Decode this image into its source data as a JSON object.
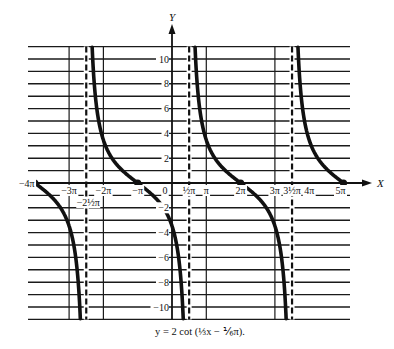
{
  "chart_data": {
    "type": "line",
    "title": "",
    "caption": "y = 2 cot (⅓x − ⅙π).",
    "function": "y = 2*cot(x/3 - pi/6)",
    "xlabel": "X",
    "ylabel": "Y",
    "xlim_pi": [
      -4,
      5
    ],
    "ylim": [
      -11,
      11
    ],
    "grid": true,
    "x_tick_labels": [
      {
        "value_pi": -4,
        "label": "−4π"
      },
      {
        "value_pi": -3,
        "label": "−3π"
      },
      {
        "value_pi": -2.5,
        "label": "−2½π"
      },
      {
        "value_pi": -2,
        "label": "−2π"
      },
      {
        "value_pi": -1,
        "label": "−π"
      },
      {
        "value_pi": 0,
        "label": "0"
      },
      {
        "value_pi": 0.5,
        "label": "½π"
      },
      {
        "value_pi": 1,
        "label": "π"
      },
      {
        "value_pi": 2,
        "label": "2π"
      },
      {
        "value_pi": 3,
        "label": "3π"
      },
      {
        "value_pi": 3.5,
        "label": "3½π"
      },
      {
        "value_pi": 4,
        "label": "4π"
      },
      {
        "value_pi": 5,
        "label": "5π"
      }
    ],
    "y_tick_labels": [
      {
        "value": 10,
        "label": "10"
      },
      {
        "value": 8,
        "label": "8"
      },
      {
        "value": 6,
        "label": "6"
      },
      {
        "value": 4,
        "label": "4"
      },
      {
        "value": 2,
        "label": "2"
      },
      {
        "value": -2,
        "label": "−2"
      },
      {
        "value": -4,
        "label": "−4"
      },
      {
        "value": -6,
        "label": "−6"
      },
      {
        "value": -8,
        "label": "−8"
      },
      {
        "value": -10,
        "label": "−10"
      }
    ],
    "asymptotes_pi": [
      -2.5,
      0.5,
      3.5
    ],
    "zeros_pi": [
      -4,
      -1,
      2,
      5
    ],
    "series": [
      {
        "name": "y = 2 cot(x/3 − π/6)",
        "branches_pi": [
          [
            -4,
            -2.5
          ],
          [
            -2.5,
            0.5
          ],
          [
            0.5,
            3.5
          ],
          [
            3.5,
            5
          ]
        ]
      }
    ],
    "solid_vertical_gridlines_pi": [
      -3,
      -2,
      1,
      3
    ],
    "sample_points": [
      {
        "x_pi": -4,
        "y": 0
      },
      {
        "x_pi": -3,
        "y": -3.46
      },
      {
        "x_pi": -2.5,
        "y": "-inf"
      },
      {
        "x_pi": -2,
        "y": 3.46
      },
      {
        "x_pi": -1,
        "y": 0
      },
      {
        "x_pi": 0,
        "y": -3.46
      },
      {
        "x_pi": 0.5,
        "y": "±inf"
      },
      {
        "x_pi": 1,
        "y": 3.46
      },
      {
        "x_pi": 2,
        "y": 0
      },
      {
        "x_pi": 3,
        "y": -3.46
      },
      {
        "x_pi": 3.5,
        "y": "±inf"
      },
      {
        "x_pi": 4,
        "y": 3.46
      },
      {
        "x_pi": 5,
        "y": 0
      }
    ]
  },
  "labels": {
    "y_axis": "Y",
    "x_axis": "X",
    "caption": "y = 2 cot (⅓x − ⅙π)."
  }
}
